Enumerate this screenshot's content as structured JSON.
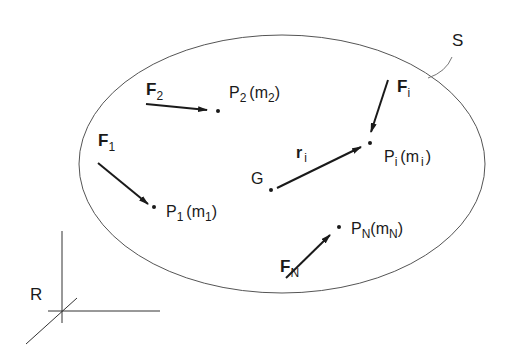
{
  "diagram": {
    "type": "rigid-body system of particles",
    "colors": {
      "stroke": "#1a1a1a",
      "ellipse": "#555555",
      "background": "#ffffff"
    },
    "system": {
      "label": "S"
    },
    "reference_frame": {
      "label": "R"
    },
    "center_of_mass": {
      "label": "G"
    },
    "position_vector": {
      "label": "r",
      "subscript": "i"
    },
    "particles": [
      {
        "id": "P1",
        "label": "P",
        "sub": "1",
        "mass": "m",
        "mass_sub": "1",
        "force": "F",
        "force_sub": "1"
      },
      {
        "id": "P2",
        "label": "P",
        "sub": "2",
        "mass": "m",
        "mass_sub": "2",
        "force": "F",
        "force_sub": "2"
      },
      {
        "id": "Pi",
        "label": "P",
        "sub": "i",
        "mass": "m",
        "mass_sub": "i",
        "force": "F",
        "force_sub": "i"
      },
      {
        "id": "PN",
        "label": "P",
        "sub": "N",
        "mass": "m",
        "mass_sub": "N",
        "force": "F",
        "force_sub": "N"
      }
    ],
    "punct": {
      "open": "(",
      "close": ")"
    }
  }
}
